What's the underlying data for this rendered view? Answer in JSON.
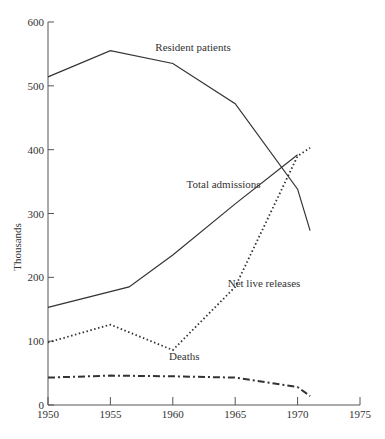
{
  "chart_data": {
    "type": "line",
    "title": "",
    "xlabel": "",
    "ylabel": "Thousands",
    "xlim": [
      1950,
      1975
    ],
    "ylim": [
      0,
      600
    ],
    "x_ticks": [
      "1950",
      "1955",
      "1960",
      "1965",
      "1970",
      "1975"
    ],
    "y_ticks": [
      "0",
      "100",
      "200",
      "300",
      "400",
      "500",
      "600"
    ],
    "grid": false,
    "legend": "inline labels",
    "series": [
      {
        "name": "Resident patients",
        "style": "solid",
        "x": [
          1950,
          1955,
          1960,
          1965,
          1970,
          1971
        ],
        "values": [
          514,
          555,
          535,
          472,
          338,
          273
        ]
      },
      {
        "name": "Total admissions",
        "style": "solid",
        "x": [
          1950,
          1956.5,
          1960,
          1965,
          1970
        ],
        "values": [
          153,
          185,
          235,
          315,
          392
        ]
      },
      {
        "name": "Net live releases",
        "style": "dotted",
        "x": [
          1950,
          1955,
          1960,
          1965,
          1970,
          1971
        ],
        "values": [
          98,
          126,
          86,
          185,
          390,
          403
        ]
      },
      {
        "name": "Deaths",
        "style": "dash-dot",
        "x": [
          1950,
          1955,
          1960,
          1965,
          1970,
          1971
        ],
        "values": [
          43,
          46,
          45,
          43,
          28,
          14
        ]
      }
    ],
    "annotations": [
      {
        "text": "Resident patients",
        "x": 1958.6,
        "y": 555
      },
      {
        "text": "Total admissions",
        "x": 1961.1,
        "y": 340
      },
      {
        "text": "Net live releases",
        "x": 1964.4,
        "y": 185
      },
      {
        "text": "Deaths",
        "x": 1959.7,
        "y": 70
      }
    ]
  }
}
